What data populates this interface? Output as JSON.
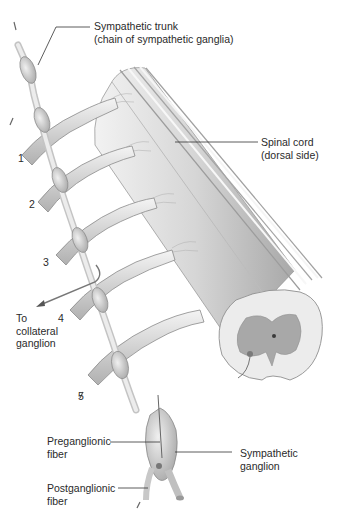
{
  "figure": {
    "labels": {
      "sympathetic_trunk": {
        "line1": "Sympathetic trunk",
        "line2": "(chain of sympathetic ganglia)"
      },
      "spinal_cord": {
        "line1": "Spinal cord",
        "line2": "(dorsal side)"
      },
      "to_collateral": {
        "line1": "To",
        "line2": "collateral",
        "line3": "ganglion"
      },
      "preganglionic": {
        "line1": "Preganglionic",
        "line2": "fiber"
      },
      "postganglionic": {
        "line1": "Postganglionic",
        "line2": "fiber"
      },
      "sympathetic_ganglion": {
        "line1": "Sympathetic",
        "line2": "ganglion"
      }
    },
    "numbers": [
      "1",
      "2",
      "3",
      "4",
      "5"
    ],
    "colors": {
      "background": "#ffffff",
      "tissue_light": "#e6e6e6",
      "tissue_mid": "#bdbdbd",
      "tissue_dark": "#8c8c8c",
      "grey_matter": "#a9a9a9",
      "leader_line": "#333333"
    }
  }
}
